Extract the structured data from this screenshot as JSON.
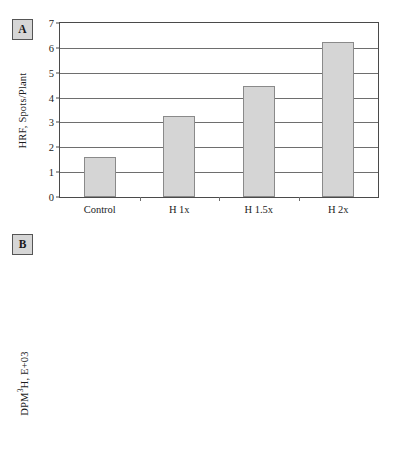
{
  "figure": {
    "panels": [
      {
        "id": "A",
        "label": "A",
        "ylabel_main": "HRF, Spots/Plant",
        "ylabel_sup": "",
        "ylabel_tail": ""
      },
      {
        "id": "B",
        "label": "B",
        "ylabel_main": "DPM",
        "ylabel_sup": "3",
        "ylabel_tail": "H, E+03"
      }
    ]
  },
  "chart_data": [
    {
      "panel": "A",
      "type": "bar",
      "title": "",
      "xlabel": "",
      "ylabel": "HRF, Spots/Plant",
      "categories": [
        "Control",
        "H 1x",
        "H 1.5x",
        "H 2x"
      ],
      "values": [
        1.62,
        3.25,
        4.45,
        6.25
      ],
      "errors": [
        null,
        null,
        null,
        null
      ],
      "significance": [
        "",
        "",
        "",
        ""
      ],
      "ylim": [
        0,
        7
      ],
      "yticks": [
        0,
        1,
        2,
        3,
        4,
        5,
        6,
        7
      ],
      "ytick_labels": [
        "0",
        "1",
        "2",
        "3",
        "4",
        "5",
        "6",
        "7"
      ],
      "grid": true,
      "legend": "none"
    },
    {
      "panel": "B",
      "type": "bar",
      "title": "",
      "xlabel": "",
      "ylabel": "DPM3H, E+03",
      "categories": [
        "Control",
        "H 1x",
        "H 1.5x",
        "H 2x"
      ],
      "values": [
        33.0,
        38.5,
        40.1,
        38.2
      ],
      "errors": [
        2.2,
        5.1,
        1.1,
        2.2
      ],
      "significance": [
        "",
        "",
        "*",
        "*"
      ],
      "ylim": [
        0,
        50
      ],
      "yticks": [
        0,
        10,
        20,
        30,
        40,
        50
      ],
      "ytick_labels": [
        "0",
        "10",
        "20",
        "30",
        "40",
        "50"
      ],
      "grid": true,
      "legend": "none"
    }
  ]
}
